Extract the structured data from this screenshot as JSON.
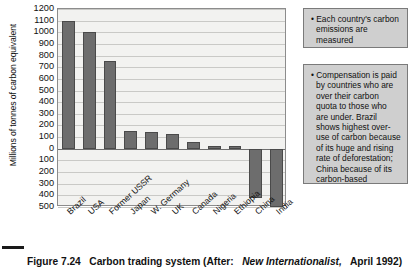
{
  "figure": {
    "caption_prefix": "Figure 7.24",
    "caption_text": "Carbon trading system (After:",
    "caption_italic": "New Internationalist,",
    "caption_suffix": "April 1992)"
  },
  "chart_data": {
    "type": "bar",
    "title": "Carbon trading system",
    "xlabel": "",
    "ylabel": "Millions of tonnes of carbon equivalent",
    "categories": [
      "Brazil",
      "USA",
      "Former USSR",
      "Japan",
      "W. Germany",
      "UK",
      "Canada",
      "Nigeria",
      "Ethiopia",
      "China",
      "India"
    ],
    "values": [
      1100,
      1000,
      750,
      150,
      145,
      130,
      60,
      25,
      25,
      -420,
      -500
    ],
    "ylim": [
      -500,
      1200
    ],
    "ytick_values": [
      1200,
      1100,
      1000,
      900,
      800,
      700,
      600,
      500,
      400,
      300,
      200,
      100,
      0,
      -100,
      -200,
      -300,
      -400,
      -500
    ],
    "ytick_labels": [
      "1200",
      "1100",
      "1000",
      "900",
      "800",
      "700",
      "600",
      "500",
      "400",
      "300",
      "200",
      "100",
      "0",
      "100",
      "200",
      "300",
      "400",
      "500"
    ],
    "grid": true,
    "legend": "none",
    "bar_color": "#6d6d6d",
    "plot_background": "#f2f2f0"
  },
  "callouts": [
    {
      "id": "callout-1",
      "text": "• Each country's carbon emissions are measured"
    },
    {
      "id": "callout-2",
      "text": "• Compensation is paid by countries who are over their carbon quota to those who are under. Brazil shows highest over-use of carbon because of its huge and rising rate of deforestation; China because of its carbon-based economy (increasing its coal consumption and heavy industry)"
    }
  ]
}
